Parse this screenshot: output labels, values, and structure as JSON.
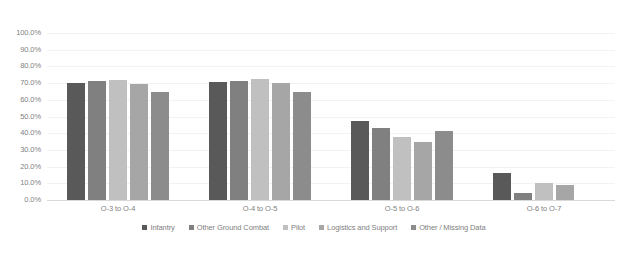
{
  "chart_data": {
    "type": "bar",
    "title": "",
    "xlabel": "",
    "ylabel": "",
    "ylim": [
      0,
      100
    ],
    "grid": true,
    "legend_position": "bottom",
    "tick_suffix": "%",
    "categories": [
      "O-3 to O-4",
      "O-4 to O-5",
      "O-5 to O-6",
      "O-6 to O-7"
    ],
    "ytick_labels": [
      "100.0%",
      "90.0%",
      "80.0%",
      "70.0%",
      "60.0%",
      "50.0%",
      "40.0%",
      "30.0%",
      "20.0%",
      "10.0%",
      "0.0%"
    ],
    "ytick_values": [
      100,
      90,
      80,
      70,
      60,
      50,
      40,
      30,
      20,
      10,
      0
    ],
    "series": [
      {
        "name": "Infantry",
        "color": "#595959",
        "values": [
          69.8,
          70.4,
          47.4,
          16.4
        ]
      },
      {
        "name": "Other Ground Combat",
        "color": "#808080",
        "values": [
          71.0,
          71.4,
          43.2,
          4.4
        ]
      },
      {
        "name": "Pilot",
        "color": "#c0c0c0",
        "values": [
          71.6,
          72.2,
          38.0,
          10.4
        ]
      },
      {
        "name": "Logistics and Support",
        "color": "#a6a6a6",
        "values": [
          69.6,
          69.8,
          35.0,
          8.8
        ]
      },
      {
        "name": "Other / Missing Data",
        "color": "#8c8c8c",
        "values": [
          64.4,
          64.8,
          41.4,
          null
        ]
      }
    ]
  },
  "legend": {
    "items": [
      {
        "label": "Infantry",
        "color": "#595959"
      },
      {
        "label": "Other Ground Combat",
        "color": "#808080"
      },
      {
        "label": "Pilot",
        "color": "#c0c0c0"
      },
      {
        "label": "Logistics and Support",
        "color": "#a6a6a6"
      },
      {
        "label": "Other / Missing Data",
        "color": "#8c8c8c"
      }
    ]
  },
  "header": {
    "cropped_title": ""
  }
}
